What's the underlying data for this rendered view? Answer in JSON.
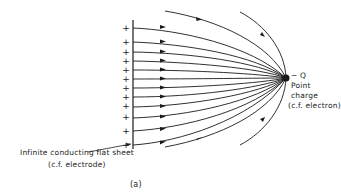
{
  "figure": {
    "caption": "(a)",
    "point_charge": {
      "symbol": "− Q",
      "label_line1": "Point",
      "label_line2": "charge",
      "label_line3": "(c.f. electron)"
    },
    "sheet": {
      "label_line1": "Infinite conducting flat sheet",
      "label_line2": "(c.f. electrode)",
      "plus_count": 12,
      "plus_symbol": "+"
    },
    "colors": {
      "line": "#1a1a1a",
      "background": "#ffffff"
    }
  }
}
